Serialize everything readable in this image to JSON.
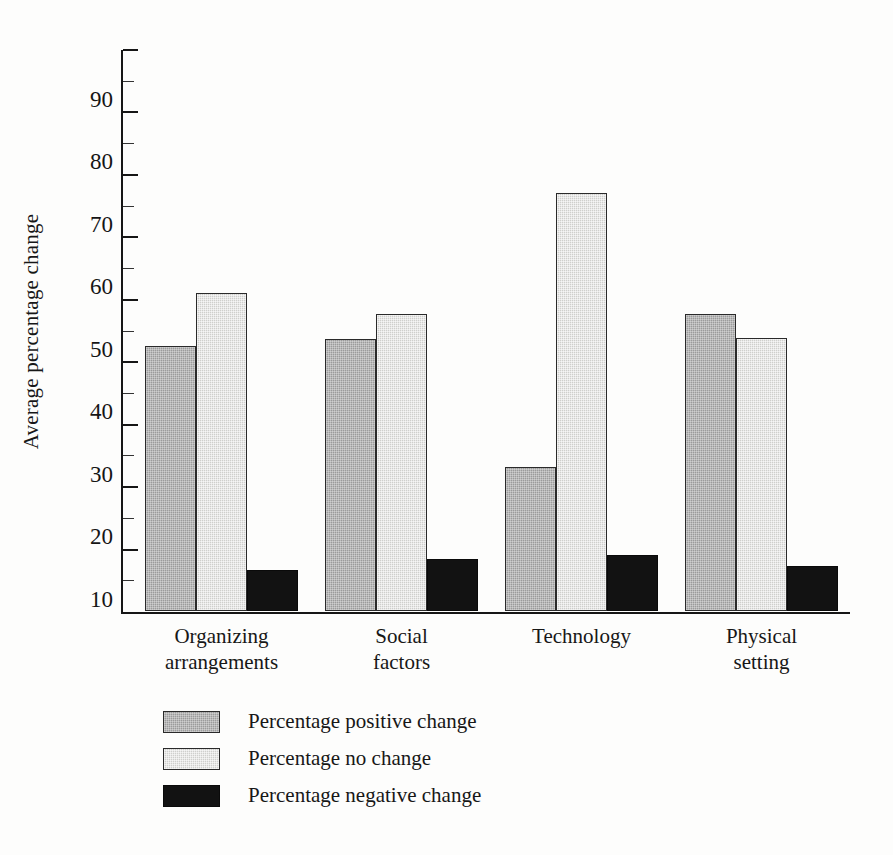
{
  "chart_data": {
    "type": "bar",
    "title": "",
    "xlabel": "",
    "ylabel": "Average percentage change",
    "ylim": [
      0,
      90
    ],
    "ytick_labels": [
      "90",
      "80",
      "70",
      "60",
      "50",
      "40",
      "30",
      "20",
      "10"
    ],
    "ytick_values": [
      90,
      80,
      70,
      60,
      50,
      40,
      30,
      20,
      10
    ],
    "grid": false,
    "legend_position": "bottom-left",
    "categories": [
      "Organizing arrangements",
      "Social factors",
      "Technology",
      "Physical setting"
    ],
    "category_lines": [
      [
        "Organizing",
        "arrangements"
      ],
      [
        "Social",
        "factors"
      ],
      [
        "Technology",
        ""
      ],
      [
        "Physical",
        "setting"
      ]
    ],
    "series": [
      {
        "name": "Percentage positive change",
        "color": "#9b9b9b",
        "values": [
          42.5,
          43.5,
          23.0,
          47.5
        ]
      },
      {
        "name": "Percentage no change",
        "color": "#cfcfcc",
        "values": [
          51.0,
          47.5,
          67.0,
          43.8
        ]
      },
      {
        "name": "Percentage negative change",
        "color": "#121212",
        "values": [
          6.6,
          8.3,
          9.0,
          7.2
        ]
      }
    ]
  },
  "legend": {
    "entries": [
      {
        "label": "Percentage positive change",
        "swatch": "positive"
      },
      {
        "label": "Percentage no change",
        "swatch": "nochange"
      },
      {
        "label": "Percentage negative change",
        "swatch": "negative"
      }
    ]
  }
}
